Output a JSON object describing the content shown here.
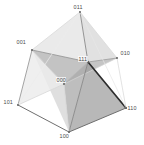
{
  "figure": {
    "background_color": "#ffffff",
    "label_color": "#4a4a4a",
    "width": 144,
    "height": 145
  },
  "chart_data": {
    "type": "diagram",
    "subtype": "3d-cube-graph",
    "title": "",
    "xlabel": "",
    "ylabel": "",
    "grid": false,
    "legend": null,
    "vertices": [
      {
        "id": "v011",
        "label": "011",
        "x": 80,
        "y": 12,
        "label_x": 73,
        "label_y": 4,
        "marker": "none"
      },
      {
        "id": "v001",
        "label": "001",
        "x": 32,
        "y": 50,
        "label_x": 16,
        "label_y": 39,
        "marker": "none"
      },
      {
        "id": "v010",
        "label": "010",
        "x": 117,
        "y": 58,
        "label_x": 120,
        "label_y": 50,
        "marker": "none"
      },
      {
        "id": "v111",
        "label": "111",
        "x": 88,
        "y": 62,
        "label_x": 78,
        "label_y": 56,
        "marker": "none"
      },
      {
        "id": "v000",
        "label": "000",
        "x": 64,
        "y": 84,
        "label_x": 56,
        "label_y": 77,
        "marker": "none"
      },
      {
        "id": "v101",
        "label": "101",
        "x": 18,
        "y": 105,
        "label_x": 3,
        "label_y": 99,
        "marker": "none"
      },
      {
        "id": "v110",
        "label": "110",
        "x": 126,
        "y": 108,
        "label_x": 127,
        "label_y": 105,
        "marker": "none"
      },
      {
        "id": "v100",
        "label": "100",
        "x": 69,
        "y": 132,
        "label_x": 59,
        "label_y": 133,
        "marker": "none"
      }
    ],
    "edges": [
      {
        "from": "v011",
        "to": "v001",
        "color": "#d9d9d9",
        "width": 0.8
      },
      {
        "from": "v011",
        "to": "v010",
        "color": "#d9d9d9",
        "width": 0.8
      },
      {
        "from": "v011",
        "to": "v111",
        "color": "#8a8a8a",
        "width": 0.9
      },
      {
        "from": "v001",
        "to": "v101",
        "color": "#9a9a9a",
        "width": 0.9
      },
      {
        "from": "v001",
        "to": "v000",
        "color": "#c8c8c8",
        "width": 0.8
      },
      {
        "from": "v001",
        "to": "v111",
        "color": "#8f8f8f",
        "width": 0.8
      },
      {
        "from": "v010",
        "to": "v110",
        "color": "#dcdcdc",
        "width": 0.8
      },
      {
        "from": "v010",
        "to": "v000",
        "color": "#d2d2d2",
        "width": 0.8
      },
      {
        "from": "v010",
        "to": "v111",
        "color": "#9a9a9a",
        "width": 0.8
      },
      {
        "from": "v111",
        "to": "v110",
        "color": "#2d2d2d",
        "width": 1.7
      },
      {
        "from": "v111",
        "to": "v100",
        "color": "#888888",
        "width": 0.9
      },
      {
        "from": "v111",
        "to": "v000",
        "color": "#b5b5b5",
        "width": 0.8
      },
      {
        "from": "v101",
        "to": "v100",
        "color": "#6f6f6f",
        "width": 1.0
      },
      {
        "from": "v101",
        "to": "v000",
        "color": "#d8d8d8",
        "width": 0.8
      },
      {
        "from": "v100",
        "to": "v110",
        "color": "#6f6f6f",
        "width": 1.0
      },
      {
        "from": "v000",
        "to": "v100",
        "color": "#d4d4d4",
        "width": 0.8
      },
      {
        "from": "v101",
        "to": "v011",
        "color": "#ededed",
        "width": 0.7
      },
      {
        "from": "v110",
        "to": "v011",
        "color": "#e6e6e6",
        "width": 0.7
      }
    ],
    "faces": [
      {
        "id": "f1",
        "vertices": [
          "v001",
          "v111",
          "v000"
        ],
        "fill": "#b9b9b9",
        "opacity": 0.85
      },
      {
        "id": "f2",
        "vertices": [
          "v111",
          "v010",
          "v000"
        ],
        "fill": "#9e9e9e",
        "opacity": 0.6
      },
      {
        "id": "f3",
        "vertices": [
          "v111",
          "v000",
          "v100"
        ],
        "fill": "#a8a8a8",
        "opacity": 0.75
      },
      {
        "id": "f4",
        "vertices": [
          "v001",
          "v000",
          "v100"
        ],
        "fill": "#dcdcdc",
        "opacity": 0.9
      },
      {
        "id": "f5",
        "vertices": [
          "v111",
          "v100",
          "v110"
        ],
        "fill": "#9a9a9a",
        "opacity": 0.7
      },
      {
        "id": "f6",
        "vertices": [
          "v011",
          "v111",
          "v010"
        ],
        "fill": "#c9c9c9",
        "opacity": 0.55
      },
      {
        "id": "f7",
        "vertices": [
          "v001",
          "v011",
          "v111"
        ],
        "fill": "#d6d6d6",
        "opacity": 0.5
      },
      {
        "id": "f8",
        "vertices": [
          "v001",
          "v101",
          "v000"
        ],
        "fill": "#ebebeb",
        "opacity": 0.8
      }
    ]
  }
}
